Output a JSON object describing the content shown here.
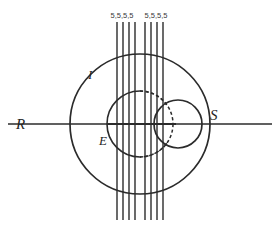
{
  "figure": {
    "title": "",
    "background_color": "#ffffff",
    "stroke_color": "#2b2b2b",
    "width": 280,
    "height": 229
  },
  "labels": {
    "left_axis": "R",
    "right_axis": "S",
    "outer_circle": "I",
    "inner_circle": "E"
  },
  "top_tick_labels": {
    "group_a": [
      "5",
      "5",
      "5",
      "5"
    ],
    "group_b": [
      "5",
      "5",
      "5",
      "5"
    ],
    "group_a_text": "5,5,5,5",
    "group_b_text": "5,5,5,5",
    "full_text": "5,5,5,5, 5,5,5,5"
  },
  "geometry": {
    "center_x": 140,
    "center_y": 124,
    "outer_circle_radius": 70,
    "inner_circle_radius": 33,
    "right_small_circle_cx": 178,
    "right_small_circle_cy": 124,
    "right_small_circle_r": 24,
    "horizontal_axis_y": 124,
    "horizontal_axis_x1": 8,
    "horizontal_axis_x2": 272,
    "vertical_lines_top_y": 22,
    "vertical_lines_bottom_y": 220,
    "vertical_lines_x": [
      117,
      123,
      129,
      135,
      145,
      151,
      157,
      163
    ],
    "vertical_line_count": 8
  },
  "elements": {
    "outer_circle_name": "outer-circle-I",
    "inner_circle_name": "inner-circle-E",
    "right_circle_name": "right-small-circle-S",
    "axis_name": "horizontal-axis-RS",
    "bundle_name": "vertical-line-bundle"
  }
}
